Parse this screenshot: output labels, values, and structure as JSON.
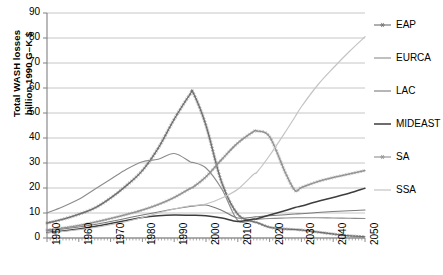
{
  "chart_data": {
    "type": "line",
    "title": "",
    "xlabel": "",
    "ylabel": "Total WASH losses billion 1990 G–K $",
    "ylabel_line1": "Total WASH losses",
    "ylabel_line2": "billion 1990 G–K $",
    "xlim": [
      1950,
      2050
    ],
    "ylim": [
      0,
      90
    ],
    "yticks": [
      0,
      10,
      20,
      30,
      40,
      50,
      60,
      70,
      80,
      90
    ],
    "xticks": [
      1950,
      1960,
      1970,
      1980,
      1990,
      2000,
      2010,
      2020,
      2030,
      2040,
      2050
    ],
    "grid": "horizontal",
    "legend_position": "right",
    "x": [
      1950,
      1955,
      1960,
      1965,
      1970,
      1975,
      1980,
      1985,
      1990,
      1995,
      1996,
      2000,
      2005,
      2010,
      2015,
      2016,
      2020,
      2025,
      2028,
      2030,
      2035,
      2040,
      2045,
      2050
    ],
    "series": [
      {
        "name": "EAP",
        "color": "#6e6e6e",
        "marker": "star",
        "width": 1.1,
        "values": [
          6.0,
          7.5,
          9.5,
          12.0,
          16.0,
          21.0,
          27.0,
          36.0,
          47.5,
          57.5,
          58.0,
          45.0,
          22.0,
          9.5,
          6.5,
          6.2,
          4.3,
          3.6,
          3.4,
          3.2,
          2.4,
          1.6,
          0.9,
          0.5
        ]
      },
      {
        "name": "EURCA",
        "color": "#8c8c8c",
        "marker": "none",
        "width": 1.1,
        "values": [
          10.0,
          12.5,
          15.5,
          19.5,
          23.5,
          27.5,
          30.5,
          31.5,
          33.8,
          30.5,
          30.2,
          28.0,
          19.5,
          7.0,
          7.4,
          7.5,
          7.8,
          8.0,
          8.1,
          8.1,
          8.1,
          8.0,
          7.9,
          7.8
        ]
      },
      {
        "name": "LAC",
        "color": "#7a7a7a",
        "marker": "none",
        "width": 1.1,
        "values": [
          3.0,
          3.6,
          4.4,
          5.4,
          6.6,
          7.9,
          9.2,
          10.4,
          11.6,
          12.6,
          12.7,
          13.2,
          11.0,
          8.0,
          8.4,
          8.5,
          8.9,
          9.3,
          9.6,
          9.7,
          10.2,
          10.6,
          10.9,
          11.2
        ]
      },
      {
        "name": "MIDEAST",
        "color": "#3d3d3d",
        "marker": "none",
        "width": 1.5,
        "values": [
          2.2,
          2.8,
          3.6,
          4.6,
          5.8,
          7.0,
          8.2,
          8.9,
          9.2,
          9.1,
          9.1,
          8.9,
          8.0,
          6.6,
          7.6,
          7.7,
          9.2,
          11.0,
          12.2,
          12.8,
          14.6,
          16.2,
          17.9,
          19.9
        ]
      },
      {
        "name": "SA",
        "color": "#8f8f8f",
        "marker": "star",
        "width": 1.1,
        "values": [
          3.2,
          4.0,
          5.0,
          6.3,
          7.8,
          9.4,
          11.2,
          13.4,
          16.2,
          19.8,
          20.4,
          24.5,
          31.5,
          38.0,
          42.6,
          42.8,
          40.5,
          26.0,
          19.0,
          20.2,
          22.5,
          24.2,
          25.6,
          27.0
        ]
      },
      {
        "name": "SSA",
        "color": "#c4c4c4",
        "marker": "none",
        "width": 1.2,
        "values": [
          2.0,
          2.6,
          3.3,
          4.2,
          5.3,
          6.6,
          8.2,
          10.0,
          11.6,
          12.9,
          13.0,
          13.6,
          16.0,
          19.5,
          25.5,
          26.3,
          33.0,
          42.5,
          48.5,
          52.5,
          61.0,
          68.0,
          74.5,
          80.5
        ]
      }
    ]
  },
  "legend": {
    "items": [
      {
        "label": "EAP"
      },
      {
        "label": "EURCA"
      },
      {
        "label": "LAC"
      },
      {
        "label": "MIDEAST"
      },
      {
        "label": "SA"
      },
      {
        "label": "SSA"
      }
    ]
  },
  "axes": {
    "y_tick_labels": [
      "0",
      "10",
      "20",
      "30",
      "40",
      "50",
      "60",
      "70",
      "80",
      "90"
    ],
    "x_tick_labels": [
      "1950",
      "1960",
      "1970",
      "1980",
      "1990",
      "2000",
      "2010",
      "2020",
      "2030",
      "2040",
      "2050"
    ]
  }
}
